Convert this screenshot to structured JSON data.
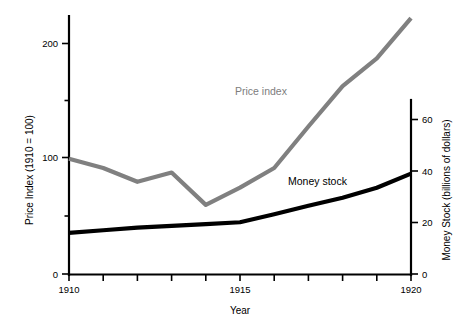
{
  "chart_data": {
    "type": "line",
    "title": "",
    "xlabel": "Year",
    "ylabel": "Price Index (1910 = 100)",
    "y2label": "Money Stock (billions of dollars)",
    "grid": false,
    "legend_position": "inline-annotation",
    "x": [
      1910,
      1911,
      1912,
      1913,
      1914,
      1915,
      1916,
      1917,
      1918,
      1919,
      1920
    ],
    "xlim": [
      1910,
      1920
    ],
    "ylim": [
      0,
      230
    ],
    "y2lim": [
      0,
      70
    ],
    "xticks": [
      1910,
      1911,
      1912,
      1913,
      1914,
      1915,
      1916,
      1917,
      1918,
      1919,
      1920
    ],
    "xticklabels": [
      "1910",
      "",
      "",
      "",
      "",
      "1915",
      "",
      "",
      "",
      "",
      "1920"
    ],
    "yticks_major": [
      0,
      100,
      200
    ],
    "yticklabels": [
      "0",
      "100",
      "200"
    ],
    "yticks_minor": [
      50,
      150
    ],
    "y2ticks": [
      0,
      20,
      40,
      60
    ],
    "y2ticklabels": [
      "0",
      "20",
      "40",
      "60"
    ],
    "series": [
      {
        "name": "Price index",
        "axis": "left",
        "color": "#808080",
        "label_text": "Price index",
        "values": [
          100,
          92,
          80,
          88,
          60,
          75,
          92,
          128,
          163,
          187,
          222
        ]
      },
      {
        "name": "Money stock",
        "axis": "right",
        "color": "#000000",
        "label_text": "Money stock",
        "values": [
          16.0,
          17.0,
          18.0,
          18.7,
          19.4,
          20.1,
          23.2,
          26.5,
          29.6,
          33.5,
          39.0
        ]
      }
    ]
  },
  "annotations": {
    "price_index_label": "Price index",
    "money_stock_label": "Money stock"
  },
  "axes": {
    "x_title": "Year",
    "y_left_title": "Price Index (1910 = 100)",
    "y_right_title": "Money Stock (billions of dollars)",
    "y_left_tick_0": "0",
    "y_left_tick_100": "100",
    "y_left_tick_200": "200",
    "y_right_tick_0": "0",
    "y_right_tick_20": "20",
    "y_right_tick_40": "40",
    "y_right_tick_60": "60",
    "x_tick_start": "1910",
    "x_tick_mid": "1915",
    "x_tick_end": "1920"
  },
  "colors": {
    "price_index": "#808080",
    "money_stock": "#000000",
    "axis": "#000000",
    "background": "#ffffff"
  }
}
